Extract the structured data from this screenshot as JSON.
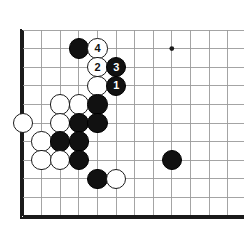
{
  "diagram": {
    "type": "go-board-problem",
    "caption": ""
  },
  "board": {
    "width_px": 244,
    "height_px": 231,
    "background_color": "#ffffff",
    "line_color": "#9a9a9a",
    "edge_line_color": "#1a1a1a",
    "cols": 12,
    "rows": 11,
    "origin_x": 23,
    "origin_y": 30,
    "spacing": 18.6,
    "left_edge_thick": true,
    "bottom_edge_thick": true,
    "top_edge_thick": false,
    "right_edge_thick": false,
    "stone_radius": 10.2,
    "star_points": [
      {
        "name": "hoshi",
        "col": 8,
        "row": 1
      }
    ]
  },
  "stones": [
    {
      "id": "s1",
      "color": "black",
      "col": 3,
      "row": 1,
      "label": ""
    },
    {
      "id": "s2",
      "color": "white",
      "col": 4,
      "row": 1,
      "label": "4"
    },
    {
      "id": "s3",
      "color": "white",
      "col": 4,
      "row": 2,
      "label": "2"
    },
    {
      "id": "s4",
      "color": "black",
      "col": 5,
      "row": 2,
      "label": "3"
    },
    {
      "id": "s5",
      "color": "white",
      "col": 4,
      "row": 3,
      "label": ""
    },
    {
      "id": "s6",
      "color": "black",
      "col": 5,
      "row": 3,
      "label": "1"
    },
    {
      "id": "s7",
      "color": "white",
      "col": 2,
      "row": 4,
      "label": ""
    },
    {
      "id": "s8",
      "color": "white",
      "col": 3,
      "row": 4,
      "label": ""
    },
    {
      "id": "s9",
      "color": "black",
      "col": 4,
      "row": 4,
      "label": ""
    },
    {
      "id": "s10",
      "color": "white",
      "col": 0,
      "row": 5,
      "label": ""
    },
    {
      "id": "s11",
      "color": "white",
      "col": 2,
      "row": 5,
      "label": ""
    },
    {
      "id": "s12",
      "color": "black",
      "col": 3,
      "row": 5,
      "label": ""
    },
    {
      "id": "s13",
      "color": "black",
      "col": 4,
      "row": 5,
      "label": ""
    },
    {
      "id": "s14",
      "color": "white",
      "col": 1,
      "row": 6,
      "label": ""
    },
    {
      "id": "s15",
      "color": "black",
      "col": 2,
      "row": 6,
      "label": ""
    },
    {
      "id": "s16",
      "color": "black",
      "col": 3,
      "row": 6,
      "label": ""
    },
    {
      "id": "s17",
      "color": "white",
      "col": 1,
      "row": 7,
      "label": ""
    },
    {
      "id": "s18",
      "color": "white",
      "col": 2,
      "row": 7,
      "label": ""
    },
    {
      "id": "s19",
      "color": "black",
      "col": 3,
      "row": 7,
      "label": ""
    },
    {
      "id": "s20",
      "color": "black",
      "col": 8,
      "row": 7,
      "label": ""
    },
    {
      "id": "s21",
      "color": "black",
      "col": 4,
      "row": 8,
      "label": ""
    },
    {
      "id": "s22",
      "color": "white",
      "col": 5,
      "row": 8,
      "label": ""
    }
  ],
  "move_sequence": [
    {
      "number": "1",
      "color": "black",
      "col": 5,
      "row": 3
    },
    {
      "number": "2",
      "color": "white",
      "col": 4,
      "row": 2
    },
    {
      "number": "3",
      "color": "black",
      "col": 5,
      "row": 2
    },
    {
      "number": "4",
      "color": "white",
      "col": 4,
      "row": 1
    }
  ]
}
